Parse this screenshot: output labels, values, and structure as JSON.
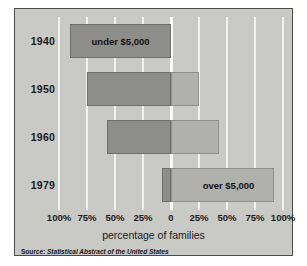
{
  "chart_data": {
    "type": "bar",
    "subtype": "diverging-horizontal-bar",
    "title": "",
    "xlabel": "percentage of families",
    "ylabel": "",
    "categories": [
      "1940",
      "1950",
      "1960",
      "1979"
    ],
    "series": [
      {
        "name": "under $5,000",
        "color": "#8d8d8a",
        "direction": "left",
        "values": [
          90,
          75,
          57,
          8
        ]
      },
      {
        "name": "over $5,000",
        "color": "#b0b0ad",
        "direction": "right",
        "values": [
          0,
          25,
          43,
          92
        ]
      }
    ],
    "xtick_values": [
      -100,
      -75,
      -50,
      -25,
      0,
      25,
      50,
      75,
      100
    ],
    "xtick_labels": [
      "100%",
      "75%",
      "50%",
      "25%",
      "0",
      "25%",
      "50%",
      "75%",
      "100%"
    ],
    "xlim": [
      -100,
      100
    ],
    "grid": true,
    "legend_position": "none",
    "annotations": [
      {
        "text": "under $5,000",
        "row": 0,
        "side": "left"
      },
      {
        "text": "over $5,000",
        "row": 3,
        "side": "right"
      }
    ],
    "source_label": "Source:",
    "source_title": "Statistical Abstract of the United States",
    "background_color": "#c9c9c6",
    "gridline_color": "#f2f2ef"
  },
  "figure": {
    "source_label": "Source:",
    "source_title": "Statistical Abstract of the United States",
    "xtitle": "percentage of families"
  },
  "rows": [
    {
      "year": "1940",
      "under": 90,
      "over": 0,
      "label": "under $5,000",
      "label_side": "left"
    },
    {
      "year": "1950",
      "under": 75,
      "over": 25,
      "label": "",
      "label_side": ""
    },
    {
      "year": "1960",
      "under": 57,
      "over": 43,
      "label": "",
      "label_side": ""
    },
    {
      "year": "1979",
      "under": 8,
      "over": 92,
      "label": "over $5,000",
      "label_side": "right"
    }
  ],
  "ticks": [
    {
      "label": "100%",
      "value": -100
    },
    {
      "label": "75%",
      "value": -75
    },
    {
      "label": "50%",
      "value": -50
    },
    {
      "label": "25%",
      "value": -25
    },
    {
      "label": "0",
      "value": 0
    },
    {
      "label": "25%",
      "value": 25
    },
    {
      "label": "50%",
      "value": 50
    },
    {
      "label": "75%",
      "value": 75
    },
    {
      "label": "100%",
      "value": 100
    }
  ]
}
